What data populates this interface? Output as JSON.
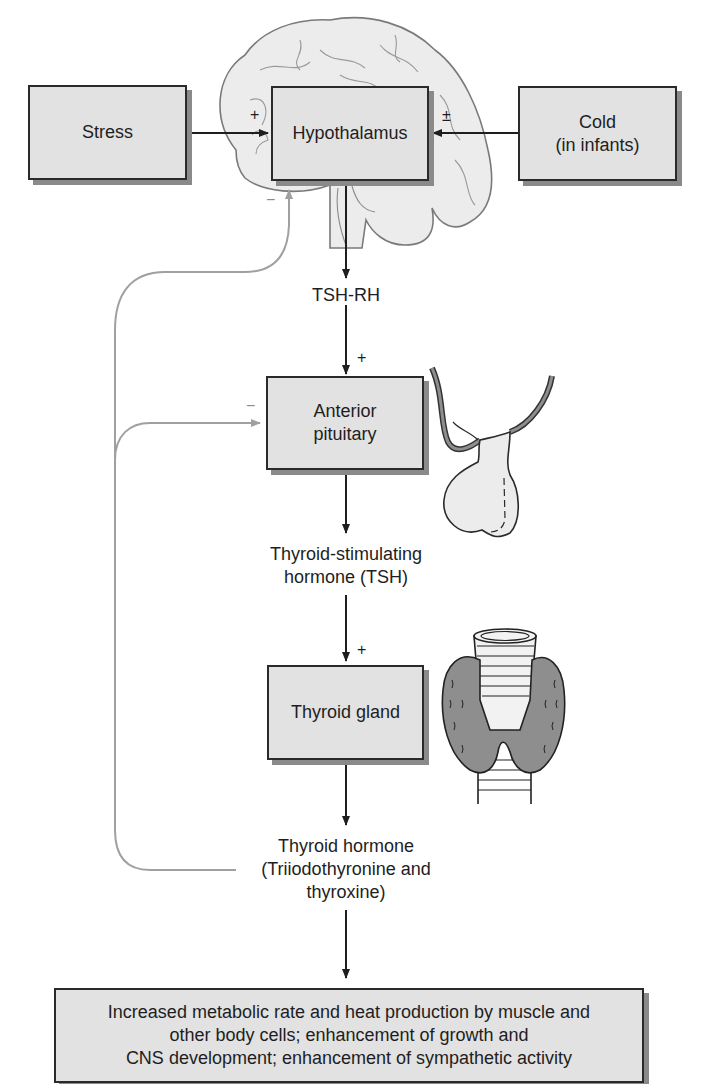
{
  "diagram": {
    "type": "flowchart",
    "topic": "Hypothalamic-pituitary-thyroid axis",
    "colors": {
      "box_fill": "#e2e2e2",
      "box_border": "#2a2a2a",
      "box_shadow": "#8a8a8a",
      "arrow": "#1e1e1e",
      "feedback_arrow": "#a0a0a0",
      "gland_fill": "#8e8e8e",
      "organ_fill": "#ececec"
    },
    "nodes": {
      "stress": {
        "label": "Stress"
      },
      "hypothalamus": {
        "label": "Hypothalamus"
      },
      "cold": {
        "label": "Cold\n(in infants)"
      },
      "tsh_rh": {
        "label": "TSH-RH"
      },
      "anterior_pituitary": {
        "label": "Anterior\npituitary"
      },
      "tsh": {
        "label": "Thyroid-stimulating\nhormone (TSH)"
      },
      "thyroid_gland": {
        "label": "Thyroid gland"
      },
      "thyroid_hormone": {
        "label": "Thyroid hormone\n(Triiodothyronine and\nthyroxine)"
      },
      "effects": {
        "label": "Increased metabolic rate and heat production by muscle and\nother body cells; enhancement of growth and\nCNS development; enhancement of sympathetic activity"
      }
    },
    "signs": {
      "stress_to_hypothalamus": "+",
      "cold_to_hypothalamus": "±",
      "tsh_rh_to_pituitary": "+",
      "tsh_to_thyroid": "+",
      "feedback_hypothalamus": "−",
      "feedback_pituitary": "−"
    },
    "edges": [
      {
        "from": "stress",
        "to": "hypothalamus",
        "sign": "+"
      },
      {
        "from": "cold",
        "to": "hypothalamus",
        "sign": "±"
      },
      {
        "from": "hypothalamus",
        "to": "tsh_rh"
      },
      {
        "from": "tsh_rh",
        "to": "anterior_pituitary",
        "sign": "+"
      },
      {
        "from": "anterior_pituitary",
        "to": "tsh"
      },
      {
        "from": "tsh",
        "to": "thyroid_gland",
        "sign": "+"
      },
      {
        "from": "thyroid_gland",
        "to": "thyroid_hormone"
      },
      {
        "from": "thyroid_hormone",
        "to": "effects"
      },
      {
        "from": "thyroid_hormone",
        "to": "hypothalamus",
        "sign": "−",
        "style": "feedback"
      },
      {
        "from": "thyroid_hormone",
        "to": "anterior_pituitary",
        "sign": "−",
        "style": "feedback"
      }
    ],
    "illustrations": [
      "brain-illustration",
      "pituitary-illustration",
      "thyroid-illustration"
    ]
  }
}
